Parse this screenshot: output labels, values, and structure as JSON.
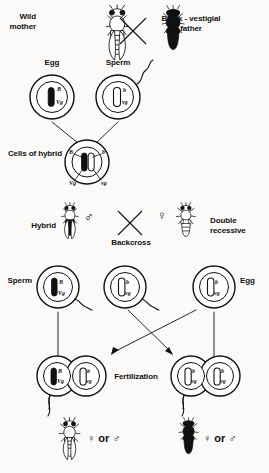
{
  "figure": {
    "width": 269,
    "height": 473,
    "background": "#fbfaf8",
    "ink": "#111111"
  },
  "parents": {
    "mother_label": "Wild\nmother",
    "father_label": "Black - vestigial\nfather",
    "cross_symbol": "×"
  },
  "gametes_p": {
    "egg_label": "Egg",
    "sperm_label": "Sperm",
    "egg_genes": {
      "top": "B",
      "bottom": "Vg"
    },
    "sperm_genes": {
      "top": "b",
      "bottom": "vg"
    }
  },
  "hybrid_cell": {
    "label": "Cells of hybrid",
    "gene_top_left": "B",
    "gene_top_right": "b",
    "gene_bottom_left": "Vg",
    "gene_bottom_right": "vg"
  },
  "backcross": {
    "hybrid_label": "Hybrid",
    "hybrid_sex": "♂",
    "cross_symbol": "×",
    "recessive_sex": "♀",
    "recessive_label": "Double\nrecessive",
    "caption": "Backcross"
  },
  "gametes_f": {
    "sperm_label": "Sperm",
    "egg_label": "Egg",
    "sperm_one": {
      "top": "B",
      "bottom": "Vg",
      "shade": "black"
    },
    "sperm_two": {
      "top": "b",
      "bottom": "vg",
      "shade": "white"
    },
    "egg_one": {
      "top": "b",
      "bottom": "vg",
      "shade": "white"
    }
  },
  "fertilization": {
    "label": "Fertilization",
    "zygote_left": {
      "cell_a": {
        "top": "B",
        "bottom": "Vg",
        "shade": "black"
      },
      "cell_b": {
        "top": "b",
        "bottom": "vg",
        "shade": "white"
      }
    },
    "zygote_right": {
      "cell_a": {
        "top": "b",
        "bottom": "vg",
        "shade": "white"
      },
      "cell_b": {
        "top": "b",
        "bottom": "vg",
        "shade": "white"
      }
    }
  },
  "offspring": {
    "left": {
      "sex": "♀ or ♂",
      "phenotype": "wild-type"
    },
    "right": {
      "sex": "♀ or ♂",
      "phenotype": "black-vestigial"
    }
  }
}
